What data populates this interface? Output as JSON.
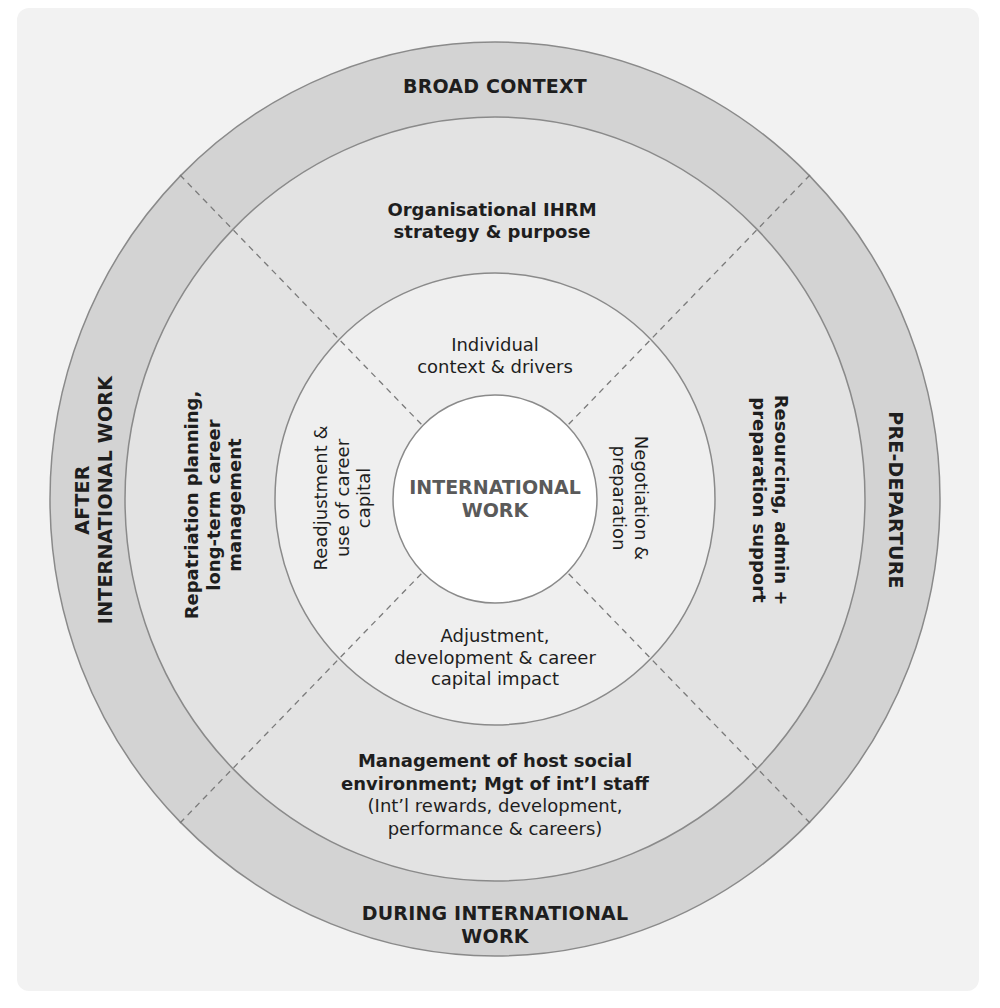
{
  "colors": {
    "background": "#ffffff",
    "panel": "#f2f2f2",
    "outer_ring": "#d3d3d3",
    "middle_ring": "#e3e3e3",
    "inner_ring": "#efefef",
    "core": "#ffffff",
    "stroke": "#8a8a8a",
    "text": "#1e1e1e",
    "core_text": "#5a5a5a"
  },
  "outer_ring": {
    "top": "BROAD CONTEXT",
    "right": "PRE-DEPARTURE",
    "bottom_line1": "DURING INTERNATIONAL",
    "bottom_line2": "WORK",
    "left_line1": "AFTER",
    "left_line2": "INTERNATIONAL WORK"
  },
  "middle_ring": {
    "top_line1": "Organisational IHRM",
    "top_line2": "strategy & purpose",
    "right_line1": "Resourcing, admin +",
    "right_line2": "preparation support",
    "bottom_line1": "Management of host social",
    "bottom_line2": "environment; Mgt of int’l staff",
    "bottom_line3": "(Int’l rewards, development,",
    "bottom_line4": "performance & careers)",
    "left_line1": "Repatriation planning,",
    "left_line2": "long-term career",
    "left_line3": "management"
  },
  "inner_ring": {
    "top_line1": "Individual",
    "top_line2": "context & drivers",
    "right_line1": "Negotiation &",
    "right_line2": "preparation",
    "bottom_line1": "Adjustment,",
    "bottom_line2": "development & career",
    "bottom_line3": "capital impact",
    "left_line1": "Readjustment &",
    "left_line2": "use of career",
    "left_line3": "capital"
  },
  "core": {
    "line1": "INTERNATIONAL",
    "line2": "WORK"
  }
}
